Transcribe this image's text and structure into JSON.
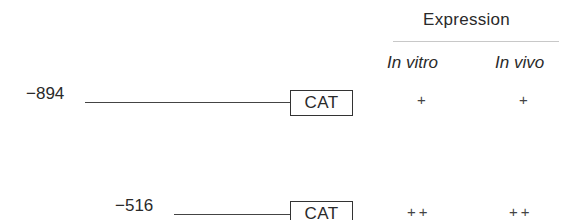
{
  "header": {
    "title": "Expression",
    "columns": [
      "In vitro",
      "In vivo"
    ]
  },
  "constructs": [
    {
      "position": "−894",
      "reporter": "CAT",
      "in_vitro": "+",
      "in_vivo": "+"
    },
    {
      "position": "−516",
      "reporter": "CAT",
      "in_vitro": "++",
      "in_vivo": "++"
    }
  ]
}
